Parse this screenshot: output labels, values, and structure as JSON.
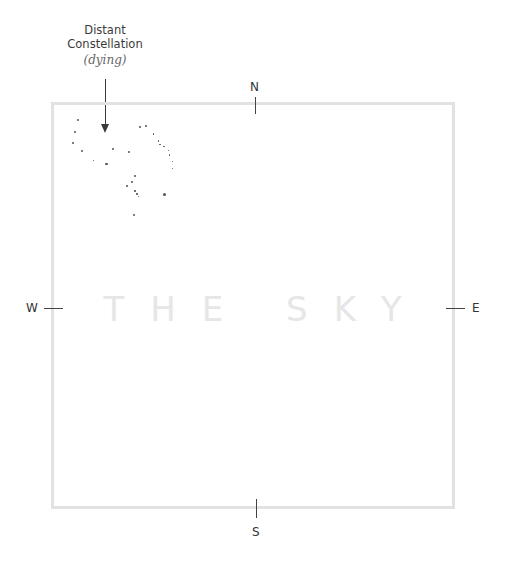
{
  "annotation": {
    "title_line1": "Distant",
    "title_line2": "Constellation",
    "subtitle": "(dying)"
  },
  "main": {
    "title": "THE SKY"
  },
  "compass": {
    "north": "N",
    "south": "S",
    "east": "E",
    "west": "W"
  },
  "colors": {
    "frame": "#e2e2e2",
    "title": "#e6e6e6",
    "ink": "#3a3a3a"
  },
  "stars": [
    {
      "x": 77.7,
      "y": 120,
      "r": 1
    },
    {
      "x": 75,
      "y": 132,
      "r": 1
    },
    {
      "x": 73.3,
      "y": 143.3,
      "r": 1
    },
    {
      "x": 82,
      "y": 151,
      "r": 1
    },
    {
      "x": 93.3,
      "y": 160.7,
      "r": 0.8
    },
    {
      "x": 106.7,
      "y": 164,
      "r": 1.4
    },
    {
      "x": 113.3,
      "y": 149,
      "r": 1.2
    },
    {
      "x": 129.3,
      "y": 152.3,
      "r": 1.1
    },
    {
      "x": 140,
      "y": 127.3,
      "r": 0.9
    },
    {
      "x": 145.7,
      "y": 126,
      "r": 0.9
    },
    {
      "x": 153.3,
      "y": 134,
      "r": 0.8
    },
    {
      "x": 158.3,
      "y": 141,
      "r": 0.8
    },
    {
      "x": 160,
      "y": 144.3,
      "r": 0.8
    },
    {
      "x": 164,
      "y": 146.7,
      "r": 0.8
    },
    {
      "x": 168.3,
      "y": 150.7,
      "r": 0.8
    },
    {
      "x": 169.3,
      "y": 155,
      "r": 0.8
    },
    {
      "x": 172.3,
      "y": 161.7,
      "r": 0.8
    },
    {
      "x": 172.3,
      "y": 168.3,
      "r": 0.8
    },
    {
      "x": 135,
      "y": 176,
      "r": 0.9
    },
    {
      "x": 131.7,
      "y": 181.7,
      "r": 0.9
    },
    {
      "x": 127.3,
      "y": 186,
      "r": 0.9
    },
    {
      "x": 135,
      "y": 191,
      "r": 0.8
    },
    {
      "x": 137,
      "y": 194,
      "r": 0.8
    },
    {
      "x": 138.3,
      "y": 196.3,
      "r": 0.8
    },
    {
      "x": 164.3,
      "y": 194.3,
      "r": 1.5
    },
    {
      "x": 134,
      "y": 215,
      "r": 1
    }
  ]
}
